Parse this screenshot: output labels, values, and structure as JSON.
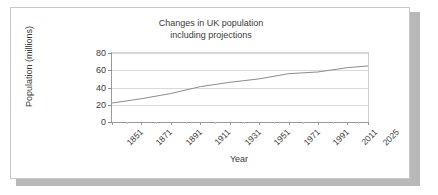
{
  "chart_data": {
    "type": "line",
    "title": "Changes in UK population including projections",
    "title_lines": [
      "Changes in UK population",
      "including projections"
    ],
    "xlabel": "Year",
    "ylabel": "Population (millions)",
    "x": [
      1851,
      1871,
      1891,
      1911,
      1931,
      1951,
      1971,
      1991,
      2011,
      2025
    ],
    "categories": [
      "1851",
      "1871",
      "1891",
      "1911",
      "1931",
      "1951",
      "1971",
      "1991",
      "2011",
      "2025"
    ],
    "values": [
      22,
      27,
      33,
      41,
      46,
      50,
      56,
      58,
      63,
      65
    ],
    "series": [
      {
        "name": "UK population",
        "values": [
          22,
          27,
          33,
          41,
          46,
          50,
          56,
          58,
          63,
          65
        ],
        "color": "#8c8c8c"
      }
    ],
    "ylim": [
      0,
      80
    ],
    "yticks": [
      0,
      20,
      40,
      60,
      80
    ],
    "ytick_labels": [
      "0",
      "20",
      "40",
      "60",
      "80"
    ],
    "grid": true,
    "legend": false,
    "legend_position": "none",
    "line_color": "#8c8c8c",
    "axis_color": "#9a9a9a",
    "text_color": "#3a3a3a",
    "background": "#ffffff"
  }
}
